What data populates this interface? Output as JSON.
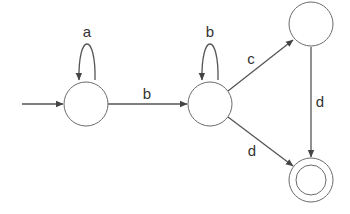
{
  "diagram": {
    "type": "finite-state-automaton",
    "states": [
      {
        "id": "s0",
        "initial": true,
        "accepting": false
      },
      {
        "id": "s1",
        "initial": false,
        "accepting": false
      },
      {
        "id": "s2",
        "initial": false,
        "accepting": false
      },
      {
        "id": "s3",
        "initial": false,
        "accepting": true
      }
    ],
    "transitions": [
      {
        "from": "s0",
        "to": "s0",
        "label": "a"
      },
      {
        "from": "s0",
        "to": "s1",
        "label": "b"
      },
      {
        "from": "s1",
        "to": "s1",
        "label": "b"
      },
      {
        "from": "s1",
        "to": "s2",
        "label": "c"
      },
      {
        "from": "s1",
        "to": "s3",
        "label": "d"
      },
      {
        "from": "s2",
        "to": "s3",
        "label": "d"
      }
    ],
    "labels": {
      "loop_s0": "a",
      "s0_s1": "b",
      "loop_s1": "b",
      "s1_s2": "c",
      "s1_s3": "d",
      "s2_s3": "d"
    },
    "colors": {
      "stroke": "#555555",
      "state_stroke": "#6b6b6b",
      "text": "#333333",
      "background": "#ffffff"
    }
  }
}
